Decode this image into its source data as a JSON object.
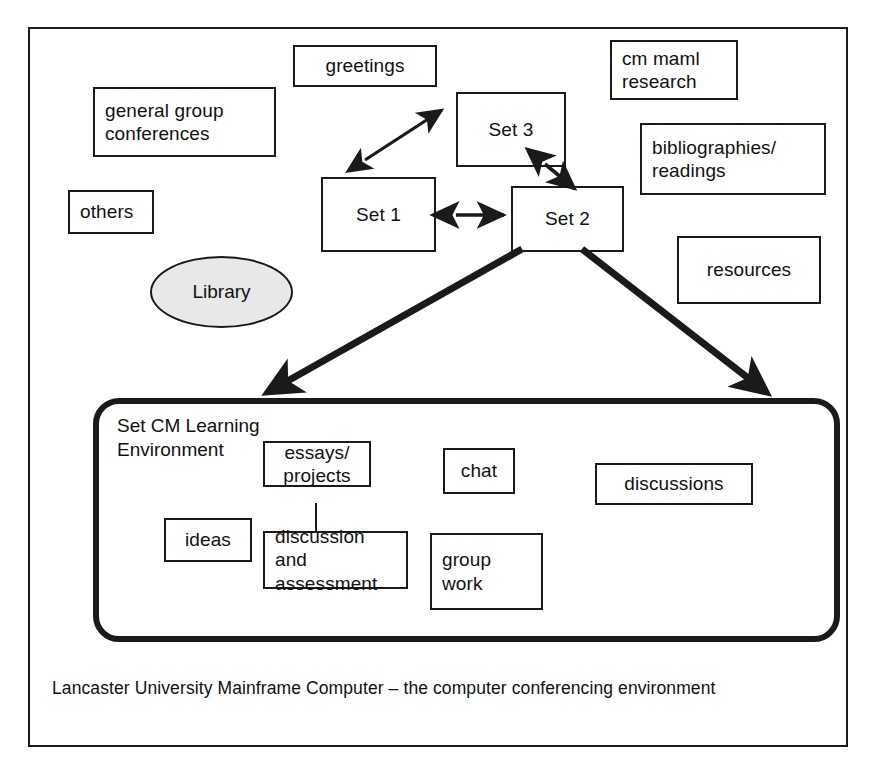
{
  "figure": {
    "caption": "Lancaster University Mainframe Computer – the computer conferencing environment",
    "frame_color": "#1a1a1a",
    "background": "#ffffff",
    "ellipse_fill": "#e8e8e8"
  },
  "top_area": {
    "nodes": [
      {
        "id": "greetings",
        "label": "greetings",
        "shape": "rect"
      },
      {
        "id": "general-group",
        "label": "general group\nconferences",
        "shape": "rect"
      },
      {
        "id": "others",
        "label": "others",
        "shape": "rect"
      },
      {
        "id": "library",
        "label": "Library",
        "shape": "ellipse"
      },
      {
        "id": "set-1",
        "label": "Set 1",
        "shape": "rect"
      },
      {
        "id": "set-2",
        "label": "Set 2",
        "shape": "rect"
      },
      {
        "id": "set-3",
        "label": "Set 3",
        "shape": "rect"
      },
      {
        "id": "cm-maml",
        "label": "cm maml\nresearch",
        "shape": "rect"
      },
      {
        "id": "bibliographies",
        "label": "bibliographies/\nreadings",
        "shape": "rect"
      },
      {
        "id": "resources",
        "label": "resources",
        "shape": "rect"
      }
    ]
  },
  "learning_env": {
    "title": "Set CM Learning\nEnvironment",
    "nodes": [
      {
        "id": "essays-projects",
        "label": "essays/\nprojects",
        "shape": "rect"
      },
      {
        "id": "ideas",
        "label": "ideas",
        "shape": "rect"
      },
      {
        "id": "discussion-assess",
        "label": "discussion and\nassessment",
        "shape": "rect"
      },
      {
        "id": "chat",
        "label": "chat",
        "shape": "rect"
      },
      {
        "id": "group-work",
        "label": "group\nwork",
        "shape": "rect"
      },
      {
        "id": "discussions",
        "label": "discussions",
        "shape": "rect"
      }
    ]
  },
  "connectors": [
    {
      "id": "set1-set3",
      "from": "Set 1 area",
      "to": "Set 3",
      "style": "double-arrow-thin"
    },
    {
      "id": "set1-set2",
      "from": "Set 1",
      "to": "Set 2",
      "style": "double-arrow-thin"
    },
    {
      "id": "set3-set2",
      "from": "Set 3",
      "to": "Set 2",
      "style": "double-arrow-thin"
    },
    {
      "id": "set2-env-l",
      "from": "Set 2",
      "to": "Set CM Learning Environment",
      "style": "single-arrow-thick"
    },
    {
      "id": "set2-env-r",
      "from": "Set 2",
      "to": "Set CM Learning Environment",
      "style": "single-arrow-thick"
    },
    {
      "id": "essays-disc",
      "from": "essays/projects",
      "to": "discussion and assessment",
      "style": "plain-line"
    }
  ]
}
